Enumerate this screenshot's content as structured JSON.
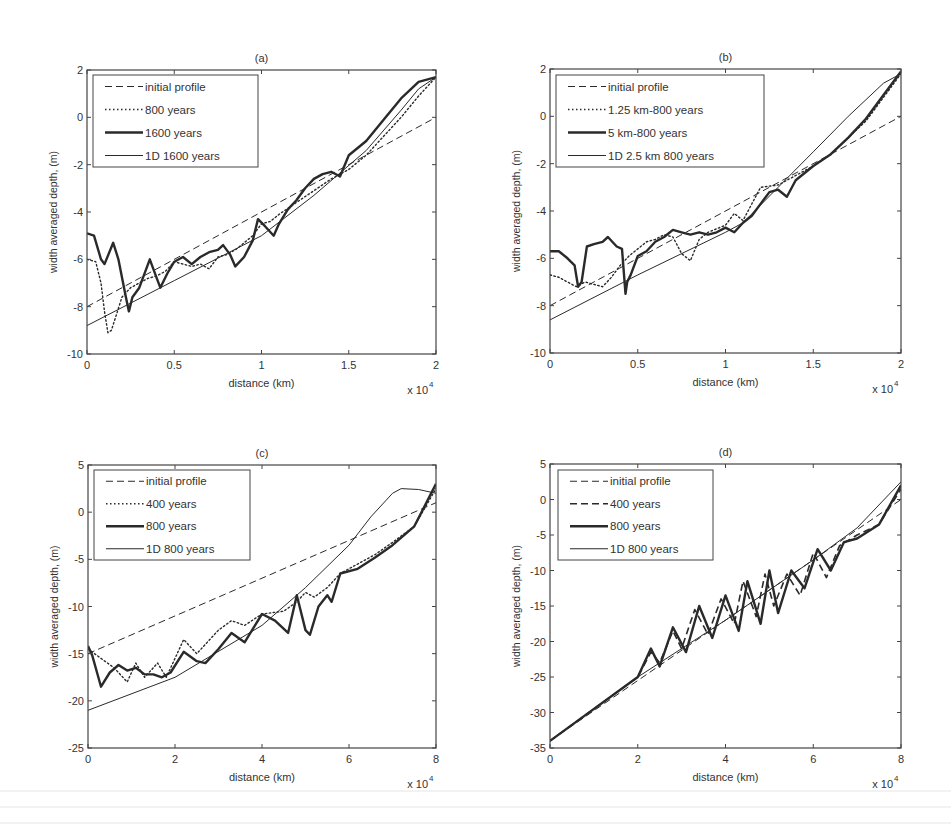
{
  "figure": {
    "bleed_lines_y": [
      790,
      806,
      822
    ]
  },
  "chart_data": [
    {
      "id": "a",
      "type": "line",
      "title": "(a)",
      "xlabel": "distance (km)",
      "ylabel": "width averaged depth, (m)",
      "x_multiplier": "x 10^4",
      "xlim": [
        0,
        2
      ],
      "ylim": [
        -10,
        2
      ],
      "xticks": [
        0,
        0.5,
        1,
        1.5,
        2
      ],
      "xtick_labels": [
        "0",
        "0.5",
        "1",
        "1.5",
        "2"
      ],
      "yticks": [
        -10,
        -8,
        -6,
        -4,
        -2,
        0,
        2
      ],
      "ytick_labels": [
        "-10",
        "-8",
        "-6",
        "-4",
        "-2",
        "0",
        "2"
      ],
      "grid": false,
      "legend_position": "upper left",
      "frame": {
        "x0": 87,
        "y0": 70,
        "x1": 436,
        "y1": 354
      },
      "legend_box": {
        "x": 93,
        "y": 75,
        "w": 165,
        "h": 92
      },
      "series": [
        {
          "name": "initial profile",
          "style": "dashed",
          "width": 1,
          "x": [
            0,
            2
          ],
          "y": [
            -8,
            0
          ]
        },
        {
          "name": "800 years",
          "style": "dotted",
          "width": 1.4,
          "x": [
            0,
            0.05,
            0.08,
            0.1,
            0.12,
            0.14,
            0.17,
            0.2,
            0.25,
            0.3,
            0.35,
            0.4,
            0.45,
            0.5,
            0.55,
            0.6,
            0.65,
            0.7,
            0.75,
            0.8,
            0.85,
            0.9,
            0.95,
            1.0,
            1.05,
            1.1,
            1.2,
            1.3,
            1.4,
            1.5,
            1.6,
            1.7,
            1.8,
            1.9,
            2.0
          ],
          "y": [
            -6.0,
            -6.1,
            -7.0,
            -8.2,
            -9.1,
            -9.0,
            -8.3,
            -7.6,
            -7.2,
            -7.0,
            -6.8,
            -6.7,
            -6.5,
            -6.1,
            -6.2,
            -6.3,
            -6.2,
            -6.4,
            -5.9,
            -5.8,
            -5.6,
            -5.3,
            -5.0,
            -4.5,
            -4.4,
            -4.1,
            -3.6,
            -3.1,
            -2.6,
            -2.2,
            -1.6,
            -0.8,
            0.0,
            0.9,
            1.7
          ]
        },
        {
          "name": "1600 years",
          "style": "solid",
          "width": 2.4,
          "x": [
            0,
            0.04,
            0.08,
            0.1,
            0.15,
            0.18,
            0.22,
            0.24,
            0.26,
            0.3,
            0.36,
            0.4,
            0.42,
            0.46,
            0.5,
            0.55,
            0.6,
            0.65,
            0.7,
            0.75,
            0.78,
            0.82,
            0.85,
            0.9,
            0.95,
            0.98,
            1.02,
            1.07,
            1.1,
            1.15,
            1.2,
            1.25,
            1.3,
            1.35,
            1.4,
            1.45,
            1.5,
            1.6,
            1.7,
            1.8,
            1.9,
            2.0
          ],
          "y": [
            -4.9,
            -5.0,
            -6.0,
            -6.2,
            -5.3,
            -6.0,
            -7.5,
            -8.2,
            -7.6,
            -7.2,
            -6.0,
            -6.8,
            -7.2,
            -6.6,
            -6.1,
            -5.9,
            -6.2,
            -5.9,
            -5.7,
            -5.6,
            -5.4,
            -5.8,
            -6.3,
            -5.9,
            -5.2,
            -4.3,
            -4.6,
            -5.0,
            -4.5,
            -3.9,
            -3.5,
            -3.0,
            -2.6,
            -2.4,
            -2.3,
            -2.5,
            -1.6,
            -1.0,
            -0.1,
            0.8,
            1.5,
            1.7
          ]
        },
        {
          "name": "1D 1600 years",
          "style": "solid",
          "width": 1,
          "x": [
            0,
            0.5,
            1.0,
            1.3,
            1.6,
            1.8,
            1.9,
            2.0
          ],
          "y": [
            -8.8,
            -6.9,
            -5.0,
            -3.3,
            -1.4,
            0.3,
            1.2,
            1.7
          ]
        }
      ]
    },
    {
      "id": "b",
      "type": "line",
      "title": "(b)",
      "xlabel": "distance (km)",
      "ylabel": "width averaged depth, (m)",
      "x_multiplier": "x 10^4",
      "xlim": [
        0,
        2
      ],
      "ylim": [
        -10,
        2
      ],
      "xticks": [
        0,
        0.5,
        1,
        1.5,
        2
      ],
      "xtick_labels": [
        "0",
        "0.5",
        "1",
        "1.5",
        "2"
      ],
      "yticks": [
        -10,
        -8,
        -6,
        -4,
        -2,
        0,
        2
      ],
      "ytick_labels": [
        "-10",
        "-8",
        "-6",
        "-4",
        "-2",
        "0",
        "2"
      ],
      "grid": false,
      "legend_position": "upper left",
      "frame": {
        "x0": 550,
        "y0": 69,
        "x1": 901,
        "y1": 353
      },
      "legend_box": {
        "x": 556,
        "y": 75,
        "w": 208,
        "h": 92
      },
      "series": [
        {
          "name": "initial profile",
          "style": "dashed",
          "width": 1,
          "x": [
            0,
            2
          ],
          "y": [
            -8,
            0
          ]
        },
        {
          "name": "1.25 km-800 years",
          "style": "dotted",
          "width": 1.4,
          "x": [
            0,
            0.05,
            0.1,
            0.15,
            0.2,
            0.25,
            0.3,
            0.35,
            0.4,
            0.45,
            0.5,
            0.55,
            0.6,
            0.65,
            0.7,
            0.75,
            0.8,
            0.85,
            0.9,
            1.0,
            1.05,
            1.1,
            1.2,
            1.3,
            1.4,
            1.5,
            1.6,
            1.7,
            1.8,
            1.9,
            2.0
          ],
          "y": [
            -6.7,
            -6.8,
            -7.0,
            -7.2,
            -7.0,
            -7.1,
            -7.2,
            -6.8,
            -6.3,
            -5.9,
            -5.6,
            -5.3,
            -5.2,
            -5.0,
            -5.1,
            -5.8,
            -6.1,
            -5.2,
            -4.9,
            -4.6,
            -4.1,
            -4.4,
            -3.0,
            -2.9,
            -2.5,
            -2.1,
            -1.6,
            -0.9,
            -0.2,
            0.8,
            1.8
          ]
        },
        {
          "name": "5 km-800 years",
          "style": "solid",
          "width": 2.4,
          "x": [
            0,
            0.05,
            0.1,
            0.14,
            0.16,
            0.18,
            0.21,
            0.25,
            0.3,
            0.33,
            0.38,
            0.41,
            0.43,
            0.44,
            0.46,
            0.5,
            0.55,
            0.6,
            0.65,
            0.7,
            0.75,
            0.8,
            0.85,
            0.9,
            0.95,
            1.0,
            1.05,
            1.1,
            1.15,
            1.2,
            1.25,
            1.3,
            1.35,
            1.4,
            1.5,
            1.6,
            1.7,
            1.8,
            1.9,
            2.0
          ],
          "y": [
            -5.7,
            -5.7,
            -6.0,
            -6.3,
            -7.2,
            -7.0,
            -5.5,
            -5.4,
            -5.3,
            -5.1,
            -5.5,
            -5.6,
            -7.5,
            -7.0,
            -6.7,
            -5.9,
            -5.7,
            -5.3,
            -5.1,
            -4.8,
            -4.9,
            -5.0,
            -4.9,
            -5.0,
            -4.9,
            -4.7,
            -4.9,
            -4.5,
            -4.2,
            -3.7,
            -3.2,
            -3.1,
            -3.4,
            -2.7,
            -2.1,
            -1.6,
            -0.9,
            -0.1,
            0.9,
            1.9
          ]
        },
        {
          "name": "1D 2.5 km 800 years",
          "style": "solid",
          "width": 1,
          "x": [
            0,
            0.5,
            1.0,
            1.1,
            1.3,
            1.5,
            1.7,
            1.9,
            2.0
          ],
          "y": [
            -8.6,
            -6.7,
            -4.9,
            -4.5,
            -3.0,
            -1.5,
            0.0,
            1.4,
            1.8
          ]
        }
      ]
    },
    {
      "id": "c",
      "type": "line",
      "title": "(c)",
      "xlabel": "distance (km)",
      "ylabel": "width averaged depth, (m)",
      "x_multiplier": "x 10^4",
      "xlim": [
        0,
        8
      ],
      "ylim": [
        -25,
        5
      ],
      "xticks": [
        0,
        2,
        4,
        6,
        8
      ],
      "xtick_labels": [
        "0",
        "2",
        "4",
        "6",
        "8"
      ],
      "yticks": [
        -25,
        -20,
        -15,
        -10,
        -5,
        0,
        5
      ],
      "ytick_labels": [
        "-25",
        "-20",
        "-15",
        "-10",
        "-5",
        "0",
        "5"
      ],
      "grid": false,
      "legend_position": "upper left",
      "frame": {
        "x0": 88,
        "y0": 465,
        "x1": 436,
        "y1": 748
      },
      "legend_box": {
        "x": 94,
        "y": 470,
        "w": 156,
        "h": 90
      },
      "series": [
        {
          "name": "initial profile",
          "style": "dashed",
          "width": 1,
          "x": [
            0,
            8
          ],
          "y": [
            -15,
            1
          ]
        },
        {
          "name": "400 years",
          "style": "dotted",
          "width": 1.4,
          "x": [
            0,
            0.3,
            0.6,
            0.9,
            1.1,
            1.3,
            1.6,
            1.8,
            2.0,
            2.2,
            2.5,
            2.8,
            3.0,
            3.3,
            3.6,
            4.0,
            4.5,
            4.8,
            5.0,
            5.2,
            5.5,
            5.8,
            6.2,
            6.6,
            7.0,
            7.5,
            8.0
          ],
          "y": [
            -14.5,
            -15.5,
            -16.5,
            -18.0,
            -16.0,
            -17.5,
            -16.0,
            -17.5,
            -15.5,
            -13.5,
            -15.0,
            -13.5,
            -12.5,
            -11.5,
            -12.0,
            -10.8,
            -10.5,
            -9.5,
            -8.5,
            -9.0,
            -8.0,
            -6.5,
            -5.5,
            -4.5,
            -3.2,
            -1.5,
            2.5
          ]
        },
        {
          "name": "800 years",
          "style": "solid",
          "width": 2.4,
          "x": [
            0,
            0.1,
            0.3,
            0.5,
            0.7,
            0.9,
            1.1,
            1.3,
            1.5,
            1.7,
            1.9,
            2.2,
            2.5,
            2.7,
            3.0,
            3.3,
            3.6,
            4.0,
            4.3,
            4.6,
            4.8,
            5.0,
            5.1,
            5.3,
            5.5,
            5.6,
            5.8,
            6.2,
            6.6,
            7.0,
            7.5,
            8.0
          ],
          "y": [
            -14.2,
            -15.2,
            -18.5,
            -17.0,
            -16.2,
            -16.8,
            -16.5,
            -17.2,
            -17.2,
            -17.5,
            -17.0,
            -14.8,
            -15.8,
            -16.0,
            -14.5,
            -12.8,
            -13.8,
            -10.8,
            -11.5,
            -12.8,
            -8.8,
            -12.5,
            -13.0,
            -10.0,
            -8.8,
            -9.5,
            -6.5,
            -6.0,
            -4.8,
            -3.5,
            -1.5,
            3.0
          ]
        },
        {
          "name": "1D 800 years",
          "style": "solid",
          "width": 1,
          "x": [
            0,
            2.0,
            4.0,
            5.0,
            6.0,
            6.5,
            7.0,
            7.2,
            7.6,
            8.0
          ],
          "y": [
            -21.0,
            -17.5,
            -12.0,
            -8.0,
            -3.5,
            -0.5,
            2.0,
            2.5,
            2.4,
            2.0
          ]
        }
      ]
    },
    {
      "id": "d",
      "type": "line",
      "title": "(d)",
      "xlabel": "distance (km)",
      "ylabel": "width averaged depth, (m)",
      "x_multiplier": "x 10^4",
      "xlim": [
        0,
        8
      ],
      "ylim": [
        -35,
        5
      ],
      "xticks": [
        0,
        2,
        4,
        6,
        8
      ],
      "xtick_labels": [
        "0",
        "2",
        "4",
        "6",
        "8"
      ],
      "yticks": [
        -35,
        -30,
        -25,
        -20,
        -15,
        -10,
        -5,
        0,
        5
      ],
      "ytick_labels": [
        "-35",
        "-30",
        "-25",
        "-20",
        "-15",
        "-10",
        "-5",
        "0",
        "5"
      ],
      "grid": false,
      "legend_position": "upper left",
      "frame": {
        "x0": 550,
        "y0": 464,
        "x1": 901,
        "y1": 748
      },
      "legend_box": {
        "x": 558,
        "y": 470,
        "w": 155,
        "h": 90
      },
      "series": [
        {
          "name": "initial profile",
          "style": "dashed",
          "width": 1,
          "x": [
            0,
            8
          ],
          "y": [
            -34,
            0
          ]
        },
        {
          "name": "400 years",
          "style": "dashed",
          "width": 1.6,
          "x": [
            0,
            2.0,
            2.3,
            2.5,
            2.8,
            3.0,
            3.3,
            3.6,
            3.9,
            4.2,
            4.4,
            4.7,
            4.9,
            5.1,
            5.4,
            5.7,
            6.0,
            6.3,
            6.6,
            7.0,
            7.5,
            8.0
          ],
          "y": [
            -34,
            -25,
            -21.5,
            -23.0,
            -18.5,
            -21.0,
            -15.5,
            -19.0,
            -14.0,
            -17.5,
            -11.5,
            -16.5,
            -10.5,
            -15.0,
            -10.5,
            -13.5,
            -7.5,
            -11.0,
            -6.5,
            -5.0,
            -3.5,
            1.5
          ]
        },
        {
          "name": "800 years",
          "style": "solid",
          "width": 2.4,
          "x": [
            0,
            2.0,
            2.3,
            2.5,
            2.8,
            3.1,
            3.4,
            3.7,
            4.0,
            4.3,
            4.5,
            4.8,
            5.0,
            5.2,
            5.5,
            5.8,
            6.1,
            6.4,
            6.7,
            7.0,
            7.5,
            8.0
          ],
          "y": [
            -34,
            -25,
            -21.0,
            -23.5,
            -18.0,
            -21.5,
            -15.0,
            -19.5,
            -13.5,
            -18.5,
            -11.5,
            -17.5,
            -10.0,
            -16.0,
            -10.0,
            -12.5,
            -7.0,
            -10.0,
            -6.0,
            -5.5,
            -3.5,
            2.0
          ]
        },
        {
          "name": "1D 800 years",
          "style": "solid",
          "width": 1,
          "x": [
            0,
            2.0,
            4.0,
            6.0,
            7.0,
            8.0
          ],
          "y": [
            -34,
            -25,
            -17.0,
            -8.5,
            -4.0,
            2.5
          ]
        }
      ]
    }
  ]
}
